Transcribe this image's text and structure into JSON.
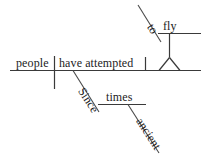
{
  "diagram": {
    "type": "reed-kellogg-sentence-diagram",
    "sentence": "Since ancient times people have attempted to fly",
    "baseline": {
      "subject": "people",
      "predicate": "have attempted"
    },
    "infinitive_phrase": {
      "preposition": "to",
      "verb": "fly"
    },
    "prepositional_phrase": {
      "preposition": "Since",
      "object": "times",
      "modifier": "ancient"
    },
    "labels": {
      "people": "people",
      "have_attempted": "have attempted",
      "to": "to",
      "fly": "fly",
      "since": "Since",
      "times": "times",
      "ancient": "ancient"
    },
    "colors": {
      "line": "#3a3a3a",
      "text": "#1c1c1c",
      "background": "#ffffff"
    }
  }
}
